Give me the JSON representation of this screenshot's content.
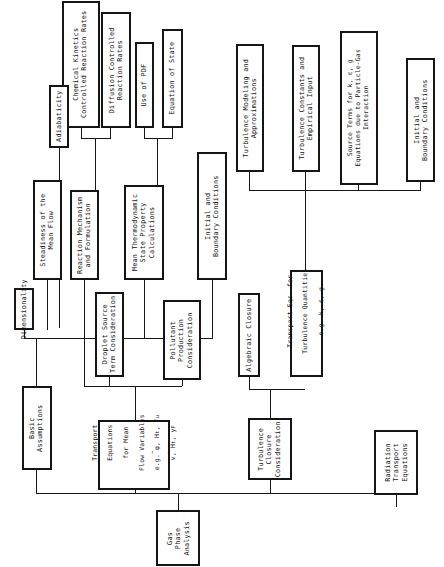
{
  "figure": {
    "orientation": "rotated-90-ccw",
    "line_color": "#151515",
    "background": "#ffffff"
  },
  "nodes": {
    "chemical_kinetics": "Chemical Kinetics\nControlled Reaction Rates",
    "diffusion_controlled": "Diffusion Controlled\nReaction Rates",
    "use_of_pdf": "Use of PDF",
    "equation_of_state": "Equation of State",
    "adiabaticity": "Adiabaticity",
    "turbulence_modeling": "Turbulence Modeling and\nApproximations",
    "turbulence_constants": "Turbulence Constants and\nEmpirical Input",
    "source_terms": "Source Terms for k, ε, g\nEquations due to Particle-Gas\nInteraction",
    "initial_bc_right": "Initial and\nBoundary Conditions",
    "steadiness": "Steadiness of the\nMean Flow",
    "reaction_mechanism": "Reaction Mechanism\nand Formulation",
    "mean_thermo": "Mean Thermodynamic\nState Property\nCalculations",
    "initial_bc_left": "Initial and\nBoundary Conditions",
    "dimensionality": "Dimensionality",
    "droplet_source": "Droplet Source\nTerm Consideration",
    "pollutant_production": "Pollutant\nProduction\nConsideration",
    "algebraic_closure": "Algebraic Closure",
    "transport_eqs_turb_l1": "Transport Eqs. for",
    "transport_eqs_turb_l2": "Turbulence Quantities",
    "transport_eqs_turb_l3": "e.g. k, ε, g",
    "basic_assumptions": "Basic\nAssumptions",
    "transport_eqs_mean_l1": "Transport",
    "transport_eqs_mean_l2": "Equations",
    "transport_eqs_mean_l3": "for Mean",
    "transport_eqs_mean_l4": "Flow Variables",
    "transport_eqs_mean_l5": "e.g. φ, H",
    "transport_eqs_mean_l5b": "t",
    "transport_eqs_mean_l5c": ", f",
    "transport_eqs_mean_l5d": "u",
    "transport_eqs_mean_l6": "v, H",
    "transport_eqs_mean_l6b": "t",
    "transport_eqs_mean_l6c": ", y",
    "transport_eqs_mean_l6d": "F",
    "turbulence_closure": "Turbulence\nClosure\nConsideration",
    "radiation_transport": "Radiation\nTransport\nEquations",
    "gas_phase_analysis": "Gas\nPhase\nAnalysis"
  },
  "edges": [
    {
      "from": "chemical_kinetics",
      "to": "reaction_mechanism"
    },
    {
      "from": "diffusion_controlled",
      "to": "reaction_mechanism"
    },
    {
      "from": "use_of_pdf",
      "to": "mean_thermo"
    },
    {
      "from": "equation_of_state",
      "to": "mean_thermo"
    },
    {
      "from": "adiabaticity",
      "to": "steadiness-bus"
    },
    {
      "from": "turbulence_modeling",
      "to": "transport_eqs_turb"
    },
    {
      "from": "turbulence_constants",
      "to": "transport_eqs_turb"
    },
    {
      "from": "source_terms",
      "to": "transport_eqs_turb"
    },
    {
      "from": "initial_bc_right",
      "to": "transport_eqs_turb"
    },
    {
      "from": "steadiness",
      "to": "basic_assumptions"
    },
    {
      "from": "dimensionality",
      "to": "basic_assumptions"
    },
    {
      "from": "reaction_mechanism",
      "to": "transport_eqs_mean"
    },
    {
      "from": "mean_thermo",
      "to": "transport_eqs_mean"
    },
    {
      "from": "initial_bc_left",
      "to": "transport_eqs_mean"
    },
    {
      "from": "droplet_source",
      "to": "transport_eqs_mean"
    },
    {
      "from": "pollutant_production",
      "to": "transport_eqs_mean"
    },
    {
      "from": "algebraic_closure",
      "to": "turbulence_closure"
    },
    {
      "from": "transport_eqs_turb",
      "to": "turbulence_closure"
    },
    {
      "from": "basic_assumptions",
      "to": "gas_phase_analysis"
    },
    {
      "from": "transport_eqs_mean",
      "to": "gas_phase_analysis"
    },
    {
      "from": "turbulence_closure",
      "to": "gas_phase_analysis"
    },
    {
      "from": "radiation_transport",
      "to": "gas_phase_analysis"
    }
  ]
}
